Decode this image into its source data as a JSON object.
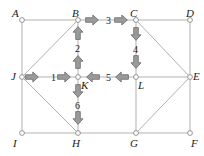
{
  "figure": {
    "width": 204,
    "height": 156,
    "background_color": "#ffffff"
  },
  "style": {
    "edge_color": "#a8a8a8",
    "edge_width": 0.9,
    "node_stroke_color": "#8a8a8a",
    "node_fill_color": "#ffffff",
    "node_radius": 2.4,
    "arrow_fill_color": "#9a9a9a",
    "arrow_stroke_color": "#6b6b6b",
    "label_color": "#1a1a1a"
  },
  "nodes": [
    {
      "id": "A",
      "label": "A",
      "x": 22,
      "y": 20,
      "label_x": 12,
      "label_y": 8
    },
    {
      "id": "B",
      "label": "B",
      "x": 78,
      "y": 20,
      "label_x": 72,
      "label_y": 8
    },
    {
      "id": "C",
      "label": "C",
      "x": 136,
      "y": 20,
      "label_x": 130,
      "label_y": 8
    },
    {
      "id": "D",
      "label": "D",
      "x": 190,
      "y": 20,
      "label_x": 186,
      "label_y": 8
    },
    {
      "id": "J",
      "label": "J",
      "x": 22,
      "y": 77,
      "label_x": 11,
      "label_y": 71
    },
    {
      "id": "K",
      "label": "K",
      "x": 78,
      "y": 77,
      "label_x": 81,
      "label_y": 80
    },
    {
      "id": "L",
      "label": "L",
      "x": 136,
      "y": 77,
      "label_x": 138,
      "label_y": 80
    },
    {
      "id": "E",
      "label": "E",
      "x": 190,
      "y": 77,
      "label_x": 193,
      "label_y": 71
    },
    {
      "id": "I",
      "label": "I",
      "x": 22,
      "y": 133,
      "label_x": 13,
      "label_y": 138
    },
    {
      "id": "H",
      "label": "H",
      "x": 78,
      "y": 133,
      "label_x": 72,
      "label_y": 138
    },
    {
      "id": "G",
      "label": "G",
      "x": 136,
      "y": 133,
      "label_x": 130,
      "label_y": 138
    },
    {
      "id": "F",
      "label": "F",
      "x": 190,
      "y": 133,
      "label_x": 191,
      "label_y": 138
    }
  ],
  "edges": [
    {
      "from": "A",
      "to": "B",
      "kind": "grid"
    },
    {
      "from": "B",
      "to": "C",
      "kind": "grid"
    },
    {
      "from": "C",
      "to": "D",
      "kind": "grid"
    },
    {
      "from": "A",
      "to": "J",
      "kind": "grid"
    },
    {
      "from": "D",
      "to": "E",
      "kind": "grid"
    },
    {
      "from": "J",
      "to": "K",
      "kind": "grid"
    },
    {
      "from": "K",
      "to": "L",
      "kind": "grid"
    },
    {
      "from": "L",
      "to": "E",
      "kind": "grid"
    },
    {
      "from": "B",
      "to": "K",
      "kind": "grid"
    },
    {
      "from": "C",
      "to": "L",
      "kind": "grid"
    },
    {
      "from": "J",
      "to": "I",
      "kind": "grid"
    },
    {
      "from": "K",
      "to": "H",
      "kind": "grid"
    },
    {
      "from": "L",
      "to": "G",
      "kind": "grid"
    },
    {
      "from": "E",
      "to": "F",
      "kind": "grid"
    },
    {
      "from": "I",
      "to": "H",
      "kind": "grid"
    },
    {
      "from": "H",
      "to": "G",
      "kind": "grid"
    },
    {
      "from": "G",
      "to": "F",
      "kind": "grid"
    },
    {
      "from": "J",
      "to": "B",
      "kind": "diagonal"
    },
    {
      "from": "C",
      "to": "E",
      "kind": "diagonal"
    },
    {
      "from": "J",
      "to": "H",
      "kind": "diagonal"
    },
    {
      "from": "G",
      "to": "E",
      "kind": "diagonal"
    }
  ],
  "steps": [
    {
      "step": "1",
      "from": "J",
      "to": "K",
      "direction": "right",
      "label_x": 51,
      "label_y": 73,
      "arrows": [
        {
          "x": 32,
          "y": 77,
          "dir": "right"
        },
        {
          "x": 64,
          "y": 77,
          "dir": "right"
        }
      ]
    },
    {
      "step": "2",
      "from": "K",
      "to": "B",
      "direction": "up",
      "label_x": 75,
      "label_y": 44,
      "arrows": [
        {
          "x": 78,
          "y": 33,
          "dir": "up"
        },
        {
          "x": 78,
          "y": 62,
          "dir": "up"
        }
      ]
    },
    {
      "step": "3",
      "from": "B",
      "to": "C",
      "direction": "right",
      "label_x": 106,
      "label_y": 16,
      "arrows": [
        {
          "x": 92,
          "y": 20,
          "dir": "right"
        },
        {
          "x": 121,
          "y": 20,
          "dir": "right"
        }
      ]
    },
    {
      "step": "4",
      "from": "C",
      "to": "L",
      "direction": "down",
      "label_x": 133,
      "label_y": 45,
      "arrows": [
        {
          "x": 136,
          "y": 34,
          "dir": "down"
        },
        {
          "x": 136,
          "y": 62,
          "dir": "down"
        }
      ]
    },
    {
      "step": "5",
      "from": "L",
      "to": "K",
      "direction": "left",
      "label_x": 106,
      "label_y": 73,
      "arrows": [
        {
          "x": 122,
          "y": 77,
          "dir": "left"
        },
        {
          "x": 93,
          "y": 77,
          "dir": "left"
        }
      ]
    },
    {
      "step": "6",
      "from": "K",
      "to": "H",
      "direction": "down",
      "label_x": 75,
      "label_y": 101,
      "arrows": [
        {
          "x": 78,
          "y": 91,
          "dir": "down"
        },
        {
          "x": 78,
          "y": 118,
          "dir": "down"
        }
      ]
    }
  ]
}
